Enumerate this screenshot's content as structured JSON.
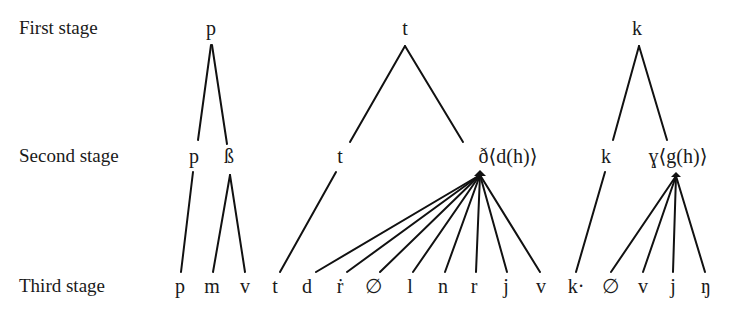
{
  "stages": [
    {
      "label": "First stage"
    },
    {
      "label": "Second stage"
    },
    {
      "label": "Third stage"
    }
  ],
  "trees": {
    "p": {
      "root": "p",
      "second": [
        "p",
        "ß"
      ],
      "third": [
        "p",
        "m",
        "v"
      ]
    },
    "t": {
      "root": "t",
      "second": [
        "t",
        "ð⟨d(h)⟩"
      ],
      "third": [
        "t",
        "d",
        "ṙ",
        "∅",
        "l",
        "n",
        "r",
        "j",
        "v"
      ]
    },
    "k": {
      "root": "k",
      "second": [
        "k",
        "ɣ⟨g(h)⟩"
      ],
      "third": [
        "k·",
        "∅",
        "v",
        "j",
        "ŋ"
      ]
    }
  }
}
